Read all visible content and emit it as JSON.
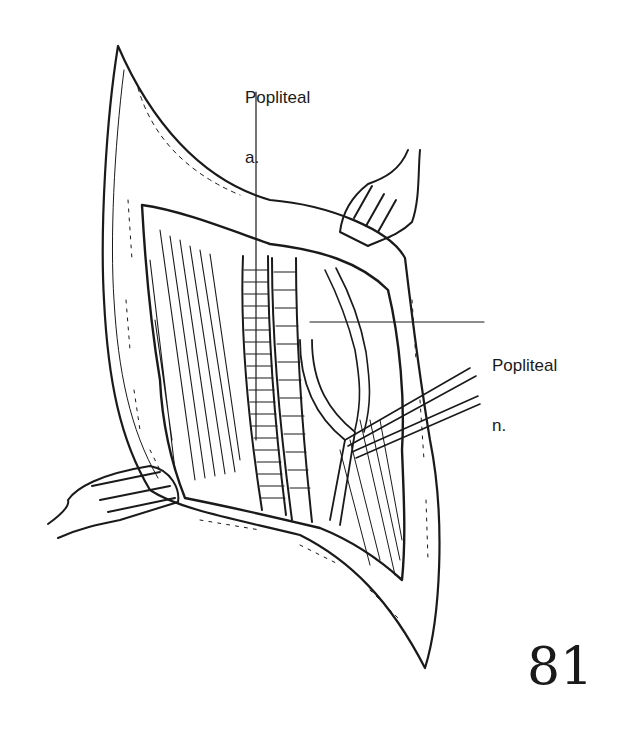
{
  "figure": {
    "number": "81",
    "labels": [
      {
        "line1": "Popliteal",
        "line2": "a.",
        "target": "popliteal-artery"
      },
      {
        "line1": "Popliteal",
        "line2": "n.",
        "target": "popliteal-nerve"
      }
    ]
  },
  "colors": {
    "ink": "#1a1a1a",
    "background": "#ffffff"
  }
}
